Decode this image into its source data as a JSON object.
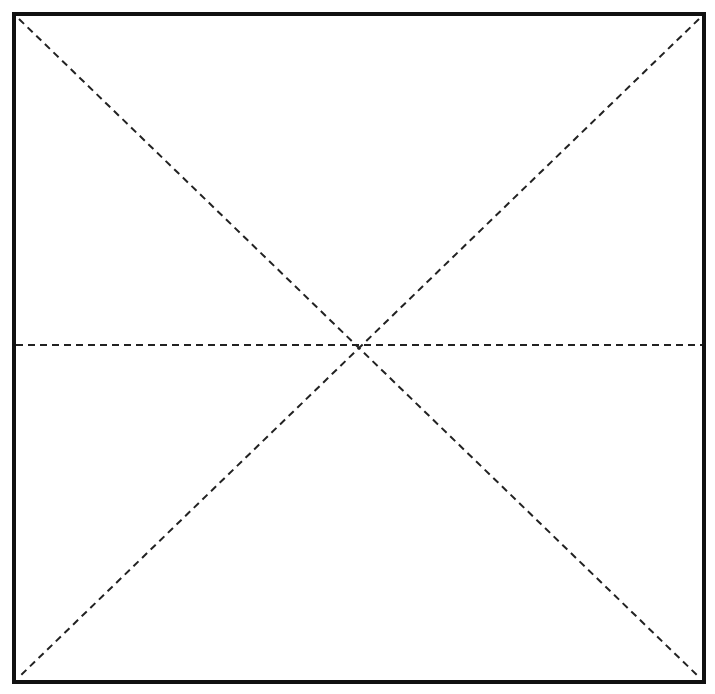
{
  "diagram": {
    "type": "origami-crease-pattern",
    "shape": "square",
    "colors": {
      "background": "#ffffff",
      "border": "#111111",
      "fold_line": "#222222"
    },
    "fold_lines": [
      {
        "name": "diagonal-top-left-to-bottom-right",
        "style": "valley-fold-dashed"
      },
      {
        "name": "diagonal-top-right-to-bottom-left",
        "style": "valley-fold-dashed"
      },
      {
        "name": "horizontal-middle",
        "style": "valley-fold-dashed"
      }
    ]
  }
}
